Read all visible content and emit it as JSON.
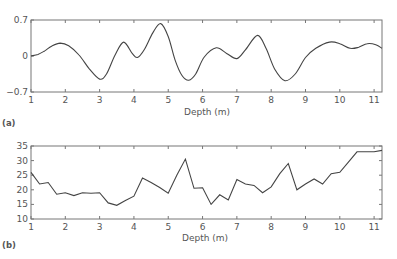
{
  "chart_data": [
    {
      "panel": "(a)",
      "type": "line",
      "title": "",
      "xlabel": "Depth (m)",
      "ylabel": "",
      "xlim": [
        1,
        11.23
      ],
      "ylim": [
        -0.7,
        0.7
      ],
      "xticks": [
        1,
        2,
        3,
        4,
        5,
        6,
        7,
        8,
        9,
        10,
        11
      ],
      "yticks": [
        -0.7,
        0,
        0.7
      ],
      "ytick_labels": [
        "−0.7",
        "0",
        "0.7"
      ],
      "grid": false,
      "x": [
        1.0,
        1.2,
        1.4,
        1.6,
        1.85,
        2.1,
        2.4,
        2.7,
        3.0,
        3.2,
        3.45,
        3.7,
        3.95,
        4.1,
        4.3,
        4.55,
        4.78,
        5.0,
        5.2,
        5.4,
        5.6,
        5.8,
        6.05,
        6.4,
        6.7,
        7.0,
        7.25,
        7.6,
        7.85,
        8.1,
        8.4,
        8.7,
        9.0,
        9.3,
        9.7,
        10.0,
        10.3,
        10.55,
        10.8,
        11.05,
        11.23
      ],
      "values": [
        0.0,
        0.03,
        0.1,
        0.19,
        0.25,
        0.2,
        0.02,
        -0.25,
        -0.45,
        -0.35,
        0.02,
        0.27,
        0.05,
        -0.03,
        0.12,
        0.45,
        0.63,
        0.38,
        -0.08,
        -0.38,
        -0.47,
        -0.35,
        -0.02,
        0.16,
        0.05,
        -0.05,
        0.12,
        0.4,
        0.15,
        -0.25,
        -0.48,
        -0.35,
        -0.03,
        0.15,
        0.27,
        0.24,
        0.15,
        0.17,
        0.24,
        0.22,
        0.15
      ]
    },
    {
      "panel": "(b)",
      "type": "line",
      "title": "",
      "xlabel": "Depth (m)",
      "ylabel": "",
      "xlim": [
        1,
        11.23
      ],
      "ylim": [
        10,
        35
      ],
      "xticks": [
        1,
        2,
        3,
        4,
        5,
        6,
        7,
        8,
        9,
        10,
        11
      ],
      "yticks": [
        10,
        15,
        20,
        25,
        30,
        35
      ],
      "grid": false,
      "x": [
        1.0,
        1.25,
        1.5,
        1.75,
        2.0,
        2.25,
        2.5,
        2.75,
        3.0,
        3.25,
        3.5,
        3.75,
        4.0,
        4.25,
        4.5,
        4.75,
        5.0,
        5.25,
        5.5,
        5.75,
        6.0,
        6.25,
        6.5,
        6.75,
        7.0,
        7.25,
        7.5,
        7.75,
        8.0,
        8.25,
        8.5,
        8.75,
        9.0,
        9.25,
        9.5,
        9.75,
        10.0,
        10.25,
        10.5,
        10.75,
        11.0,
        11.23
      ],
      "values": [
        26,
        22,
        22.5,
        18.5,
        19,
        18,
        19,
        18.8,
        19,
        15.5,
        14.7,
        16.3,
        17.8,
        24,
        22.5,
        20.8,
        18.8,
        25,
        30.5,
        20.5,
        20.7,
        15,
        18.3,
        16.5,
        23.5,
        22,
        21.5,
        19,
        21,
        25.5,
        29,
        20,
        22,
        23.7,
        22,
        25.5,
        26,
        29.5,
        33,
        33,
        33,
        33.5
      ]
    }
  ],
  "labels": {
    "panel_a": "(a)",
    "panel_b": "(b)",
    "xlabel_a": "Depth (m)",
    "xlabel_b": "Depth (m)"
  }
}
